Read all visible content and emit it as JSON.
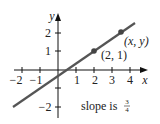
{
  "diagram": {
    "type": "line-graph",
    "axes": {
      "x_label": "x",
      "y_label": "y",
      "x_ticks": [
        "−2",
        "−1",
        "1",
        "2",
        "3",
        "4"
      ],
      "y_ticks": [
        "2",
        "1",
        "−2"
      ]
    },
    "line": {
      "equation": "y = 3/4 x - 1/2",
      "slope": "3/4",
      "color": "#555555"
    },
    "points": [
      {
        "label": "(2, 1)",
        "x": 2,
        "y": 1
      },
      {
        "label": "(x, y)",
        "x": 3.5,
        "y": 2.125
      }
    ],
    "annotation": {
      "text": "slope is",
      "num": "3",
      "den": "4"
    }
  }
}
